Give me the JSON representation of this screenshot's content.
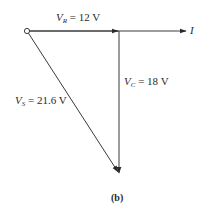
{
  "figure": {
    "caption": "(b)",
    "type": "phasor-diagram",
    "colors": {
      "line": "#3a3a3a",
      "background": "#ffffff"
    }
  },
  "phasors": {
    "vr": {
      "symbol": "V",
      "subscript": "R",
      "value_text": " = 12 V",
      "magnitude": 12,
      "unit": "V",
      "direction": "right"
    },
    "vc": {
      "symbol": "V",
      "subscript": "C",
      "value_text": " = 18 V",
      "magnitude": 18,
      "unit": "V",
      "direction": "down"
    },
    "vs": {
      "symbol": "V",
      "subscript": "S",
      "value_text": " = 21.6 V",
      "magnitude": 21.6,
      "unit": "V",
      "direction": "diagonal-down-right"
    },
    "current": {
      "symbol": "I",
      "direction": "right"
    }
  }
}
